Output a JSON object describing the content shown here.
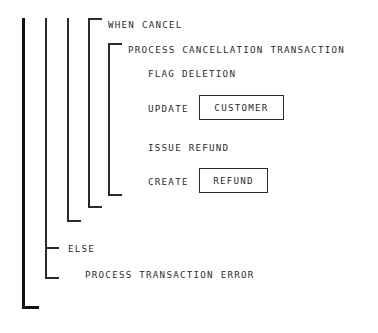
{
  "diagram": {
    "type": "action-diagram",
    "title": "",
    "statements": [
      {
        "id": "when-cancel",
        "text": "WHEN CANCEL",
        "x": 108,
        "y": 19,
        "level": 4
      },
      {
        "id": "process-cancel-txn",
        "text": "PROCESS CANCELLATION TRANSACTION",
        "x": 128,
        "y": 44,
        "level": 5
      },
      {
        "id": "flag-deletion",
        "text": "FLAG DELETION",
        "x": 148,
        "y": 68,
        "level": 6
      },
      {
        "id": "update",
        "text": "UPDATE",
        "x": 148,
        "y": 103,
        "level": 6
      },
      {
        "id": "issue-refund",
        "text": "ISSUE REFUND",
        "x": 148,
        "y": 142,
        "level": 6
      },
      {
        "id": "create",
        "text": "CREATE",
        "x": 148,
        "y": 176,
        "level": 6
      },
      {
        "id": "else",
        "text": "ELSE",
        "x": 68,
        "y": 243,
        "level": 2
      },
      {
        "id": "process-txn-error",
        "text": "PROCESS TRANSACTION ERROR",
        "x": 85,
        "y": 269,
        "level": 3
      }
    ],
    "entities": [
      {
        "id": "customer-entity",
        "text": "CUSTOMER",
        "x": 199,
        "y": 95,
        "width": 85,
        "height": 25
      },
      {
        "id": "refund-entity",
        "text": "REFUND",
        "x": 199,
        "y": 168,
        "width": 69,
        "height": 25
      }
    ],
    "brackets": [
      {
        "id": "bracket-outer",
        "x": 22,
        "top": 18,
        "bottom": 308,
        "foot": 17,
        "thick": true,
        "head": false
      },
      {
        "id": "bracket-else-block",
        "x": 45,
        "top": 18,
        "bottom": 278,
        "foot": 14,
        "thick": false,
        "head": false
      },
      {
        "id": "bracket-when-group",
        "x": 67,
        "top": 18,
        "bottom": 221,
        "foot": 14,
        "thick": false,
        "head": false
      },
      {
        "id": "bracket-when-cancel",
        "x": 88,
        "top": 18,
        "bottom": 207,
        "foot": 14,
        "thick": false,
        "head": true,
        "headLen": 14
      },
      {
        "id": "bracket-process-cancel",
        "x": 108,
        "top": 43,
        "bottom": 195,
        "foot": 14,
        "thick": false,
        "head": true,
        "headLen": 14
      }
    ],
    "ticks": [
      {
        "id": "tick-else",
        "x": 45,
        "y": 247,
        "length": 14
      }
    ],
    "colors": {
      "line": "#2a2a2a",
      "line_bold": "#111111",
      "text": "#2b2b2b",
      "background": "#ffffff"
    }
  }
}
